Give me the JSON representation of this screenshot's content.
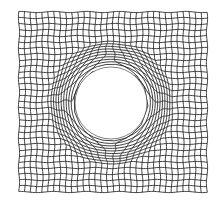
{
  "figure": {
    "description": "Structured quadrilateral mesh of a square plate with a central circular hole",
    "width": 222,
    "height": 204,
    "background": "#ffffff",
    "line_color": "#2a2a2a",
    "line_width": 0.9,
    "plate": {
      "x0": 19,
      "y0": 12,
      "x1": 207,
      "y1": 192
    },
    "hole": {
      "cx": 111,
      "cy": 103,
      "r": 36,
      "fill": "#ffffff"
    },
    "grid": {
      "cols": 33,
      "rows": 31,
      "influence_radius": 62,
      "waviness": 0.6
    }
  }
}
